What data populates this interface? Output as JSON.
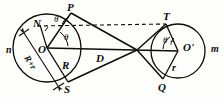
{
  "figure": {
    "kind": "geometry-diagram",
    "stroke_color": "#0d0d0d",
    "background_color": "#fdfdfb"
  },
  "labels": {
    "circle_left_name": "n",
    "circle_right_name": "m",
    "center_left": "O",
    "center_right": "O'",
    "point_top_left": "P",
    "point_bottom_left": "S",
    "point_top_right": "T",
    "point_bottom_right": "Q",
    "point_normal": "N",
    "radius_large": "R",
    "radius_small": "r",
    "radius_small_upper": "r",
    "center_distance": "D",
    "dimension_sum": "R+r",
    "angle_p": "θ",
    "angle_o": "θ",
    "angle_t": "θ"
  },
  "geometry": {
    "left_circle": {
      "cx": 47,
      "cy": 48,
      "r": 34
    },
    "right_circle": {
      "cx": 178,
      "cy": 51,
      "r": 27
    },
    "crossing_point": {
      "x": 137,
      "y": 50
    },
    "P": {
      "x": 71,
      "y": 13
    },
    "S": {
      "x": 68,
      "y": 82
    },
    "T": {
      "x": 166,
      "y": 24
    },
    "Q": {
      "x": 163,
      "y": 79
    },
    "N": {
      "x": 40,
      "y": 25
    }
  }
}
